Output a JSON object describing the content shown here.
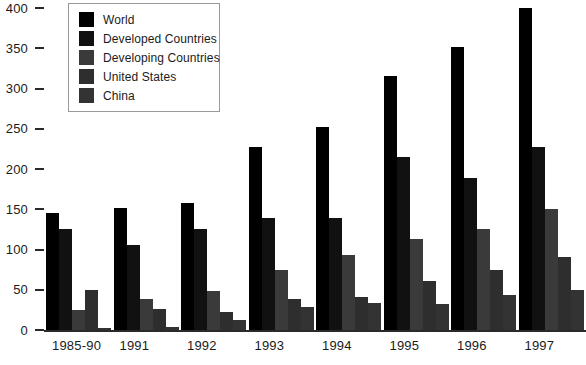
{
  "chart_data": {
    "type": "bar",
    "title": "",
    "subtitle": "",
    "xlabel": "",
    "ylabel": "",
    "categories": [
      "1985-90",
      "1991",
      "1992",
      "1993",
      "1994",
      "1995",
      "1996",
      "1997"
    ],
    "series": [
      {
        "name": "World",
        "color": "#000000",
        "values": [
          145,
          151,
          158,
          227,
          252,
          315,
          352,
          400
        ]
      },
      {
        "name": "Developed Countries",
        "color": "#111111",
        "values": [
          125,
          106,
          126,
          139,
          139,
          215,
          189,
          227
        ]
      },
      {
        "name": "Developing Countries",
        "color": "#3a3a3a",
        "values": [
          25,
          38,
          49,
          74,
          93,
          113,
          126,
          150
        ]
      },
      {
        "name": "United States",
        "color": "#2e2e2e",
        "values": [
          50,
          26,
          23,
          38,
          41,
          61,
          75,
          91
        ]
      },
      {
        "name": "China",
        "color": "#333333",
        "values": [
          3,
          4,
          12,
          28,
          33,
          32,
          43,
          50
        ]
      }
    ],
    "ylim": [
      0,
      400
    ],
    "yticks": [
      0,
      50,
      100,
      150,
      200,
      250,
      300,
      350,
      400
    ],
    "ytick_labels": [
      "0",
      "50",
      "100",
      "150",
      "200",
      "250",
      "300",
      "350",
      "400"
    ],
    "grid": false,
    "legend_position": "top-left",
    "axis_color": "#2a2a2a",
    "background": "#ffffff"
  },
  "legend": {
    "items": [
      {
        "label": "World"
      },
      {
        "label": "Developed Countries"
      },
      {
        "label": "Developing Countries"
      },
      {
        "label": "United States"
      },
      {
        "label": "China"
      }
    ]
  }
}
